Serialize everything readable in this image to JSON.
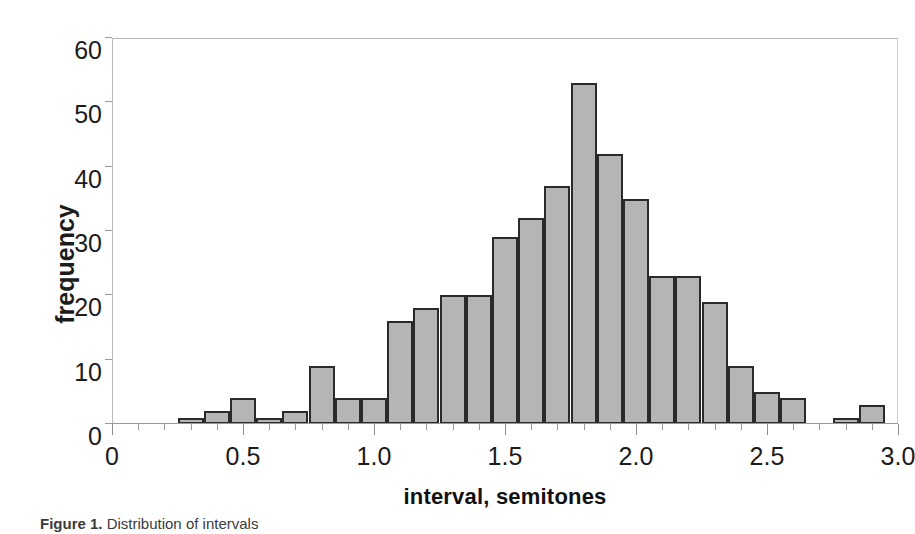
{
  "chart_data": {
    "type": "bar",
    "title": "",
    "subtitle": "",
    "xlabel": "interval, semitones",
    "ylabel": "frequency",
    "xlim": [
      0,
      3.0
    ],
    "ylim": [
      0,
      60
    ],
    "grid": false,
    "legend": null,
    "bin_width": 0.1,
    "x_major_ticks": [
      "0",
      "0.5",
      "1.0",
      "1.5",
      "2.0",
      "2.5",
      "3.0"
    ],
    "x_major_tick_values": [
      0,
      0.5,
      1.0,
      1.5,
      2.0,
      2.5,
      3.0
    ],
    "x_minor_tick_step": 0.1,
    "y_ticks": [
      "0",
      "10",
      "20",
      "30",
      "40",
      "50",
      "60"
    ],
    "y_tick_values": [
      0,
      10,
      20,
      30,
      40,
      50,
      60
    ],
    "bin_starts": [
      0.25,
      0.35,
      0.45,
      0.55,
      0.65,
      0.75,
      0.85,
      0.95,
      1.05,
      1.15,
      1.25,
      1.35,
      1.45,
      1.55,
      1.65,
      1.75,
      1.85,
      1.95,
      2.05,
      2.15,
      2.25,
      2.35,
      2.45,
      2.55,
      2.75,
      2.85
    ],
    "categories": [
      "0.25",
      "0.35",
      "0.45",
      "0.55",
      "0.65",
      "0.75",
      "0.85",
      "0.95",
      "1.05",
      "1.15",
      "1.25",
      "1.35",
      "1.45",
      "1.55",
      "1.65",
      "1.75",
      "1.85",
      "1.95",
      "2.05",
      "2.15",
      "2.25",
      "2.35",
      "2.45",
      "2.55",
      "2.75",
      "2.85"
    ],
    "values": [
      1,
      2,
      4,
      1,
      2,
      9,
      4,
      4,
      16,
      18,
      20,
      20,
      29,
      32,
      37,
      53,
      42,
      35,
      23,
      23,
      19,
      9,
      5,
      4,
      1,
      3
    ],
    "bar_fill_color": "#b5b5b5",
    "bar_edge_color": "#2a2a2a",
    "axis_color": "#9a9a9a",
    "background_color": "#ffffff"
  },
  "caption": {
    "label": "Figure 1.",
    "text": "Distribution of intervals"
  }
}
